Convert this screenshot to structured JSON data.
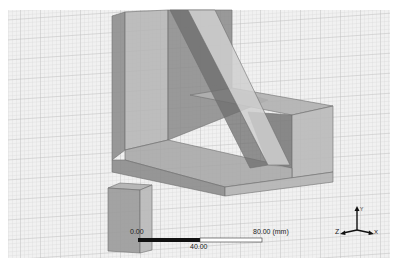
{
  "viewport": {
    "background": "#ffffff",
    "grid_color": "#c8c8c8",
    "grid_bg": "#f2f2f2"
  },
  "scale_bar": {
    "label_start": "0.00",
    "label_mid": "40.00",
    "label_end": "80.00 (mm)"
  },
  "axis_triad": {
    "x_label": "X",
    "y_label": "Y",
    "z_label": "Z"
  },
  "model": {
    "solids": [
      "bracket-back-plate",
      "bracket-base-plate",
      "bracket-right-block",
      "bracket-rib",
      "small-box"
    ]
  }
}
